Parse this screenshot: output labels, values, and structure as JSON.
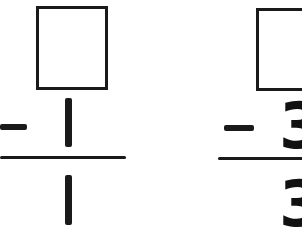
{
  "problems": [
    {
      "top": "",
      "operator": "−",
      "subtrahend": "1",
      "result": "1"
    },
    {
      "top": "",
      "operator": "−",
      "subtrahend": "3",
      "result": "3"
    }
  ],
  "colors": {
    "ink": "#1a1a1a",
    "paper": "#ffffff"
  }
}
